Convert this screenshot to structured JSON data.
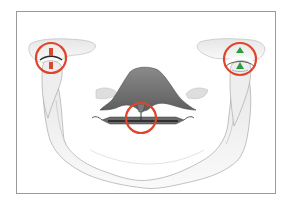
{
  "figure": {
    "frame_color": "#9a9a9a",
    "bone_stroke_color": "#8c8c8c",
    "bone_fill_color": "#f1f1f1",
    "palate_color": "#6e6e6e",
    "highlight_color": "#e0452b",
    "markers": [
      {
        "id": "left-tmj",
        "cx": 51,
        "cy": 58,
        "r": 15,
        "marker_color": "#d9472f"
      },
      {
        "id": "central-appliance",
        "cx": 141,
        "cy": 118,
        "r": 15,
        "marker_color": "#555555"
      },
      {
        "id": "right-tmj",
        "cx": 240,
        "cy": 59,
        "r": 16,
        "marker_color": "#2e9a3e"
      }
    ]
  }
}
